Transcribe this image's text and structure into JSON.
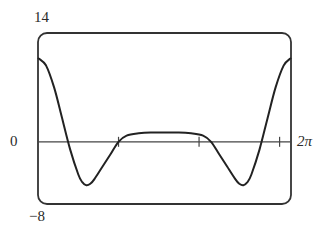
{
  "chart_data": {
    "type": "line",
    "title": "",
    "xlabel": "",
    "ylabel": "",
    "xlim": [
      0,
      6.2832
    ],
    "ylim": [
      -8,
      14
    ],
    "x_tick_positions": [
      2,
      4,
      6
    ],
    "axis_labels": {
      "y_top": "14",
      "y_bottom": "−8",
      "y_zero": "0",
      "x_right": "2π"
    },
    "grid": false,
    "legend": null,
    "series": [
      {
        "name": "f(x)",
        "x": [
          0,
          0.2,
          0.4,
          0.6,
          0.8,
          1.0,
          1.1,
          1.2,
          1.3,
          1.4,
          1.6,
          1.8,
          2.0,
          2.2,
          2.5,
          2.8,
          3.14,
          3.5,
          3.8,
          4.1,
          4.3,
          4.5,
          4.7,
          4.9,
          5.0,
          5.1,
          5.2,
          5.3,
          5.5,
          5.7,
          5.9,
          6.1,
          6.2832
        ],
        "y": [
          10.8,
          9.8,
          7.0,
          3.0,
          -1.0,
          -4.2,
          -5.2,
          -5.6,
          -5.4,
          -4.8,
          -3.2,
          -1.6,
          0,
          0.8,
          1.1,
          1.2,
          1.2,
          1.2,
          1.1,
          0.8,
          0,
          -1.6,
          -3.2,
          -4.8,
          -5.4,
          -5.6,
          -5.2,
          -4.2,
          -1.0,
          3.0,
          7.0,
          9.8,
          10.8
        ]
      }
    ]
  },
  "style": {
    "line_color": "#222222",
    "frame_color": "#333333",
    "axis_color": "#444444"
  }
}
